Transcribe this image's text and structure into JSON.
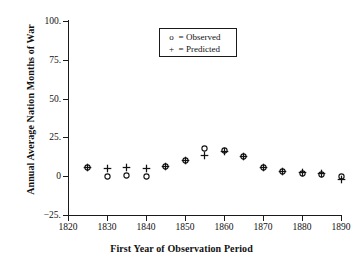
{
  "chart_data": {
    "type": "scatter",
    "title": "",
    "xlabel": "First Year of Observation Period",
    "ylabel": "Annual Average Nation Months of War",
    "xlim": [
      1820,
      1890
    ],
    "ylim": [
      -25,
      100
    ],
    "xticks": [
      "1820",
      "1830",
      "1840",
      "1850",
      "1860",
      "1870",
      "1880",
      "1890"
    ],
    "xtick_values": [
      1820,
      1830,
      1840,
      1850,
      1860,
      1870,
      1880,
      1890
    ],
    "yticks": [
      "100.",
      "75.",
      "50.",
      "25.",
      "0",
      "−25."
    ],
    "ytick_values": [
      100,
      75,
      50,
      25,
      0,
      -25
    ],
    "grid": false,
    "legend_position": "top-center",
    "x": [
      1825,
      1830,
      1835,
      1840,
      1845,
      1850,
      1855,
      1860,
      1865,
      1870,
      1875,
      1880,
      1885,
      1890
    ],
    "series": [
      {
        "name": "Observed",
        "marker": "o",
        "values": [
          5.5,
          0.0,
          0.2,
          0.0,
          6.0,
          9.8,
          17.8,
          16.6,
          13.0,
          5.5,
          3.0,
          2.0,
          1.2,
          0.0
        ]
      },
      {
        "name": "Predicted",
        "marker": "+",
        "values": [
          5.8,
          5.2,
          5.8,
          5.0,
          6.2,
          10.0,
          13.2,
          16.0,
          13.0,
          5.5,
          3.0,
          2.2,
          1.8,
          -2.2
        ]
      }
    ]
  },
  "legend": {
    "rows": [
      {
        "glyph": "o",
        "eq": "=",
        "label": "Observed"
      },
      {
        "glyph": "+",
        "eq": "=",
        "label": "Predicted"
      }
    ]
  }
}
